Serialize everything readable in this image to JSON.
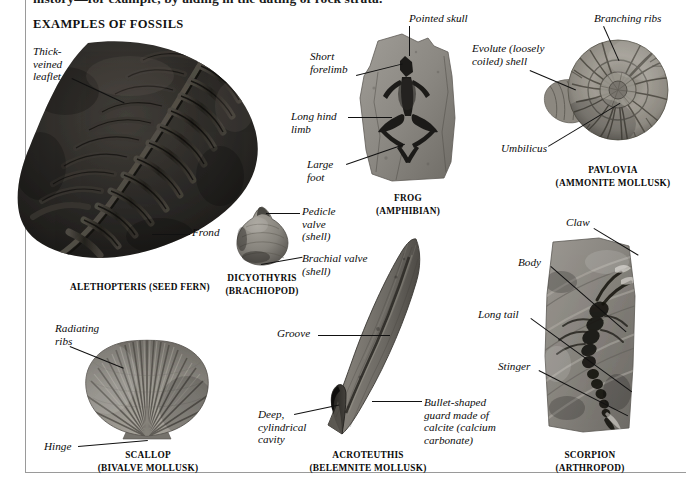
{
  "page": {
    "running_text": "history—for example, by aiding in the dating of rock strata.",
    "section_heading": "EXAMPLES OF FOSSILS",
    "background": "#ffffff",
    "rule_color": "#9a9a9a"
  },
  "specimens": [
    {
      "id": "alethopteris",
      "caption": "ALETHOPTERIS (SEED FERN)",
      "tone": "#2b2a28",
      "labels": [
        {
          "name": "thick-veined-leaflet",
          "text": "Thick-\nveined\nleaflet"
        },
        {
          "name": "frond",
          "text": "Frond"
        }
      ]
    },
    {
      "id": "frog",
      "caption": "FROG\n(AMPHIBIAN)",
      "tone": "#8d8b86",
      "labels": [
        {
          "name": "pointed-skull",
          "text": "Pointed skull"
        },
        {
          "name": "short-forelimb",
          "text": "Short\nforelimb"
        },
        {
          "name": "long-hind-limb",
          "text": "Long hind\nlimb"
        },
        {
          "name": "large-foot",
          "text": "Large\nfoot"
        }
      ]
    },
    {
      "id": "pavlovia",
      "caption": "PAVLOVIA\n(AMMONITE MOLLUSK)",
      "tone": "#9a978f",
      "labels": [
        {
          "name": "branching-ribs",
          "text": "Branching ribs"
        },
        {
          "name": "evolute-shell",
          "text": "Evolute (loosely\ncoiled) shell"
        },
        {
          "name": "umbilicus",
          "text": "Umbilicus"
        }
      ]
    },
    {
      "id": "dicyothyris",
      "caption": "DICYOTHYRIS\n(BRACHIOPOD)",
      "tone": "#8e8b84",
      "labels": [
        {
          "name": "pedicle-valve",
          "text": "Pedicle\nvalve\n(shell)"
        },
        {
          "name": "brachial-valve",
          "text": "Brachial valve\n(shell)"
        }
      ]
    },
    {
      "id": "scallop",
      "caption": "SCALLOP\n(BIVALVE MOLLUSK)",
      "tone": "#908d87",
      "labels": [
        {
          "name": "radiating-ribs",
          "text": "Radiating\nribs"
        },
        {
          "name": "hinge",
          "text": "Hinge"
        }
      ]
    },
    {
      "id": "acroteuthis",
      "caption": "ACROTEUTHIS\n(BELEMNITE MOLLUSK)",
      "tone": "#706d67",
      "labels": [
        {
          "name": "groove",
          "text": "Groove"
        },
        {
          "name": "deep-cylindrical-cavity",
          "text": "Deep,\ncylindrical\ncavity"
        },
        {
          "name": "bullet-shaped-guard",
          "text": "Bullet-shaped\nguard made of\ncalcite (calcium\ncarbonate)"
        }
      ]
    },
    {
      "id": "scorpion",
      "caption": "SCORPION\n(ARTHROPOD)",
      "tone": "#8a8782",
      "labels": [
        {
          "name": "claw",
          "text": "Claw"
        },
        {
          "name": "body",
          "text": "Body"
        },
        {
          "name": "long-tail",
          "text": "Long tail"
        },
        {
          "name": "stinger",
          "text": "Stinger"
        }
      ]
    }
  ]
}
